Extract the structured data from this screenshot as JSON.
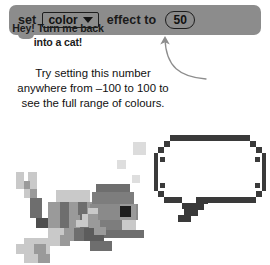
{
  "block": {
    "label_set": "set",
    "dropdown_value": "color",
    "dropdown_caret": "chevron-down-icon",
    "label_effect_to": "effect to",
    "value": "50",
    "block_color": "#8c8c8c",
    "outline_color": "#1d1d1d"
  },
  "annotation": {
    "line1": "Try setting this number",
    "line2": "anywhere from –100 to 100 to",
    "line3": "see the full range of colours.",
    "arrow": "curved-up-arrow-icon",
    "text_color": "#111111"
  },
  "speech_bubble": {
    "line1": "Hey! Turn me back",
    "line2": "into a cat!",
    "border_color": "#3a3a3a",
    "fill_color": "#ffffff"
  },
  "sprite": {
    "name": "pixelated-fish-sprite",
    "bubbles": "rising-bubbles",
    "colors": {
      "light": "#c9c9c9",
      "mid": "#9a9a9a",
      "dark": "#6e6e6e",
      "darkest": "#232323",
      "bubble": "#dcdcdc"
    }
  }
}
